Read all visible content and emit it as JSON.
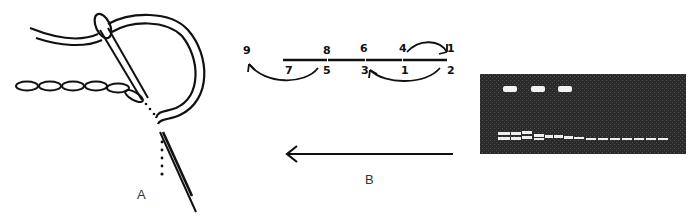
{
  "figure": {
    "panels": [
      {
        "id": "A",
        "label": "A",
        "description": "Needle passing through fabric to form a chain of stem stitches; thread looped through needle eye"
      },
      {
        "id": "B",
        "label": "B",
        "description": "Stitch sequence diagram with numbered needle points; arrow shows working direction right to left",
        "points": {
          "top": [
            "9",
            "8",
            "6",
            "4"
          ],
          "bottom": [
            "7",
            "5",
            "3",
            "1",
            "2"
          ],
          "top_right": "1"
        },
        "point_labels": [
          {
            "text": "9",
            "pos": "top-left"
          },
          {
            "text": "8",
            "pos": "top"
          },
          {
            "text": "6",
            "pos": "top"
          },
          {
            "text": "4",
            "pos": "top"
          },
          {
            "text": "1",
            "pos": "top-right"
          },
          {
            "text": "7",
            "pos": "bottom"
          },
          {
            "text": "5",
            "pos": "bottom"
          },
          {
            "text": "3",
            "pos": "bottom"
          },
          {
            "text": "1",
            "pos": "bottom"
          },
          {
            "text": "2",
            "pos": "bottom-right"
          }
        ],
        "direction": "right-to-left"
      },
      {
        "id": "C",
        "description": "Photograph of stitched sample on dark woven fabric",
        "colors": {
          "fabric": "#2a2a2a",
          "thread": "#f2f2f2"
        }
      }
    ]
  }
}
